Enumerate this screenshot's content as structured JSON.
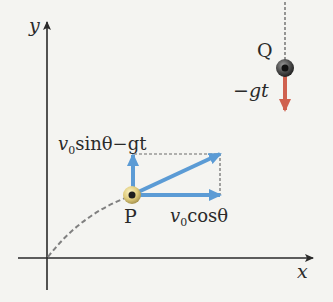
{
  "figure": {
    "colors": {
      "background": "#f4f4f1",
      "axis": "#2a2a2a",
      "velocity_blue": "#5b9bd5",
      "gravity_red": "#d0614f",
      "dashed": "#777777"
    },
    "axes": {
      "x_label": "x",
      "y_label": "y"
    },
    "particle_p": {
      "label": "P",
      "horizontal_component": {
        "v": "v",
        "sub": "0",
        "rest": "cosθ"
      },
      "vertical_component": {
        "v": "v",
        "sub": "0",
        "rest": "sinθ−gt"
      }
    },
    "particle_q": {
      "label": "Q",
      "velocity_label": "−gt"
    }
  }
}
